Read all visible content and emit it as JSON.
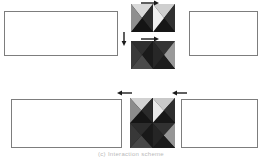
{
  "figure": {
    "caption": "(c) Interaction scheme",
    "background": "#ffffff",
    "panel_border_color": "#7d7d7d",
    "arrow_color": "#1a1a1a"
  },
  "panels": [
    {
      "id": "panel-top-left",
      "label": "",
      "x": 4,
      "y": 11,
      "w": 114,
      "h": 45
    },
    {
      "id": "panel-top-right",
      "label": "",
      "x": 189,
      "y": 11,
      "w": 69,
      "h": 45
    },
    {
      "id": "panel-bottom-left",
      "label": "",
      "x": 11,
      "y": 99,
      "w": 111,
      "h": 49
    },
    {
      "id": "panel-bottom-right",
      "label": "",
      "x": 181,
      "y": 99,
      "w": 77,
      "h": 49
    }
  ],
  "texture_blocks": [
    {
      "id": "texture-block-top",
      "x": 131,
      "y": 4,
      "w": 44,
      "h": 28,
      "cols": 2,
      "rows": 1,
      "cells": [
        {
          "top": "#d9d9d9",
          "right": "#2b2b2b",
          "bottom": "#141414",
          "left": "#8f8f8f"
        },
        {
          "top": "#cfcfcf",
          "right": "#303030",
          "bottom": "#161616",
          "left": "#efefef"
        }
      ]
    },
    {
      "id": "texture-block-middle",
      "x": 131,
      "y": 41,
      "w": 44,
      "h": 28,
      "cols": 2,
      "rows": 1,
      "cells": [
        {
          "top": "#2f2f2f",
          "right": "#1a1a1a",
          "bottom": "#4a4a4a",
          "left": "#3a3a3a"
        },
        {
          "top": "#343434",
          "right": "#9a9a9a",
          "bottom": "#1d1d1d",
          "left": "#272727"
        }
      ]
    },
    {
      "id": "texture-block-bottom",
      "x": 130,
      "y": 98,
      "w": 45,
      "h": 50,
      "cols": 2,
      "rows": 2,
      "cells": [
        {
          "top": "#d2d2d2",
          "right": "#2a2a2a",
          "bottom": "#151515",
          "left": "#8c8c8c"
        },
        {
          "top": "#c9c9c9",
          "right": "#2e2e2e",
          "bottom": "#171717",
          "left": "#e8e8e8"
        },
        {
          "top": "#2c2c2c",
          "right": "#191919",
          "bottom": "#474747",
          "left": "#383838"
        },
        {
          "top": "#313131",
          "right": "#969696",
          "bottom": "#1b1b1b",
          "left": "#252525"
        }
      ]
    }
  ],
  "arrows": [
    {
      "id": "arrow-top-into-block",
      "direction": "right",
      "x": 141,
      "y": 0,
      "len": 18
    },
    {
      "id": "arrow-down-left-of-blocks",
      "direction": "down",
      "x": 121,
      "y": 32,
      "len": 14
    },
    {
      "id": "arrow-mid-into-block",
      "direction": "right",
      "x": 141,
      "y": 36,
      "len": 18
    },
    {
      "id": "arrow-bottom-left-in",
      "direction": "left",
      "x": 117,
      "y": 90,
      "len": 15
    },
    {
      "id": "arrow-bottom-right-in",
      "direction": "left",
      "x": 172,
      "y": 90,
      "len": 15
    }
  ]
}
